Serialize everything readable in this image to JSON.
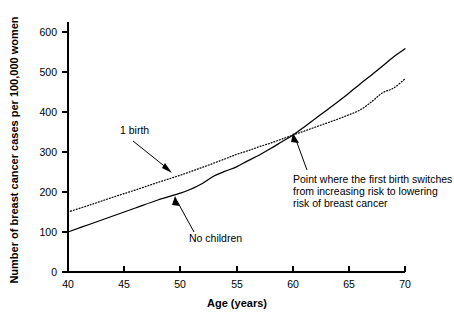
{
  "chart_data": {
    "type": "line",
    "title": "",
    "xlabel": "Age (years)",
    "ylabel": "Number of breast cancer cases per 100,000 women",
    "xlim": [
      40,
      70
    ],
    "ylim": [
      0,
      650
    ],
    "xticks": [
      40,
      45,
      50,
      55,
      60,
      65,
      70
    ],
    "yticks": [
      0,
      100,
      200,
      300,
      400,
      500,
      600
    ],
    "grid": false,
    "legend_position": "inline-annotations",
    "series": [
      {
        "name": "No children",
        "style": "solid",
        "x": [
          40,
          42,
          44,
          46,
          48,
          50,
          51,
          52,
          53,
          54,
          55,
          56,
          57,
          58,
          59,
          60,
          61,
          62,
          63,
          64,
          65,
          66,
          67,
          68,
          69,
          70
        ],
        "values": [
          100,
          120,
          140,
          160,
          180,
          197,
          208,
          222,
          240,
          252,
          263,
          278,
          292,
          308,
          325,
          342,
          362,
          383,
          404,
          425,
          447,
          470,
          492,
          515,
          538,
          558
        ]
      },
      {
        "name": "1 birth",
        "style": "dotted",
        "x": [
          40,
          42,
          44,
          46,
          48,
          50,
          52,
          54,
          55,
          56,
          57,
          58,
          59,
          60,
          61,
          62,
          63,
          64,
          65,
          66,
          67,
          68,
          69,
          70
        ],
        "values": [
          150,
          168,
          187,
          205,
          224,
          242,
          262,
          283,
          294,
          303,
          313,
          322,
          332,
          342,
          352,
          362,
          372,
          382,
          393,
          405,
          425,
          448,
          460,
          483
        ]
      }
    ],
    "annotations": [
      {
        "id": "one-birth",
        "text": "1 birth",
        "label_x": 43.1,
        "label_y": 393,
        "target_x": 49.2,
        "target_y": 257
      },
      {
        "id": "no-children",
        "text": "No children",
        "label_x": 51.5,
        "label_y": 117,
        "target_x": 49.8,
        "target_y": 196
      },
      {
        "id": "crossover",
        "text_lines": [
          "Point where the first birth switches",
          "from increasing risk to lowering",
          "risk of breast cancer"
        ],
        "label_x": 60.8,
        "label_y": 262,
        "target_x": 60.0,
        "target_y": 348
      }
    ]
  },
  "colors": {
    "axis": "#000000",
    "series_solid": "#000000",
    "series_dotted": "#000000",
    "background": "#ffffff"
  }
}
